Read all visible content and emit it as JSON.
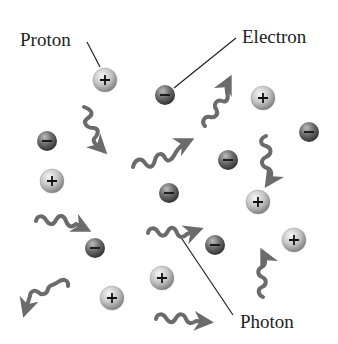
{
  "labels": {
    "proton": "Proton",
    "electron": "Electron",
    "photon": "Photon"
  },
  "colors": {
    "proton_light": "#e8e8e8",
    "proton_dark": "#8a8a8a",
    "electron_light": "#b0b0b0",
    "electron_dark": "#3e3e3e",
    "photon": "#6b6b6b",
    "leader_line": "#222222"
  },
  "particles": {
    "protons": [
      {
        "x": 105,
        "y": 80
      },
      {
        "x": 263,
        "y": 98
      },
      {
        "x": 52,
        "y": 181
      },
      {
        "x": 258,
        "y": 202
      },
      {
        "x": 294,
        "y": 240
      },
      {
        "x": 162,
        "y": 278
      },
      {
        "x": 112,
        "y": 298
      }
    ],
    "electrons": [
      {
        "x": 165,
        "y": 95
      },
      {
        "x": 47,
        "y": 141
      },
      {
        "x": 309,
        "y": 132
      },
      {
        "x": 228,
        "y": 160
      },
      {
        "x": 169,
        "y": 193
      },
      {
        "x": 95,
        "y": 248
      },
      {
        "x": 215,
        "y": 245
      }
    ]
  }
}
